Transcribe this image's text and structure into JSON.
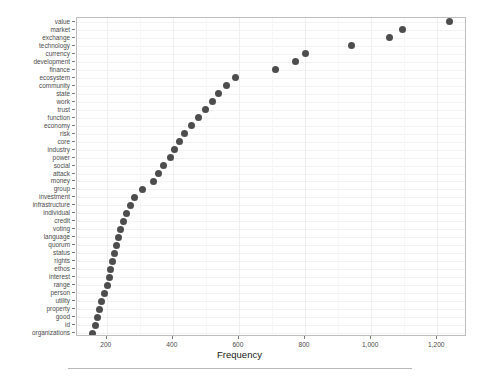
{
  "chart_data": {
    "type": "scatter",
    "title": "",
    "subtitle": "",
    "xlabel": "Frequency",
    "ylabel": "",
    "orientation": "horizontal",
    "grid": true,
    "legend": null,
    "xlim": [
      110,
      1290
    ],
    "xticks": [
      200,
      400,
      600,
      800,
      1000,
      1200
    ],
    "xticklabels": [
      "200",
      "400",
      "600",
      "800",
      "1,000",
      "1,200"
    ],
    "categories": [
      "value",
      "market",
      "exchange",
      "technology",
      "currency",
      "development",
      "finance",
      "ecosystem",
      "community",
      "state",
      "work",
      "trust",
      "function",
      "economy",
      "risk",
      "core",
      "industry",
      "power",
      "social",
      "attack",
      "money",
      "group",
      "investment",
      "infrastructure",
      "individual",
      "credit",
      "voting",
      "language",
      "quorum",
      "status",
      "rights",
      "ethos",
      "interest",
      "range",
      "person",
      "utility",
      "property",
      "good",
      "id",
      "organizations"
    ],
    "values": [
      1236,
      1094,
      1057,
      940,
      800,
      772,
      712,
      589,
      563,
      538,
      520,
      499,
      478,
      455,
      436,
      420,
      404,
      392,
      372,
      357,
      340,
      307,
      283,
      271,
      259,
      250,
      243,
      236,
      228,
      222,
      217,
      212,
      207,
      203,
      193,
      185,
      178,
      172,
      165,
      157
    ],
    "point_color": "#4d4d4d",
    "panel_border_color": "#bdbdbd",
    "gridline_color": "#f2f2f4"
  },
  "footer": {
    "rule": ""
  }
}
